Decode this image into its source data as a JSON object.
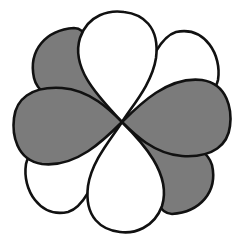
{
  "diagram": {
    "title": "",
    "center": [
      122,
      122
    ],
    "colors": {
      "shaded": "#7b7b7b",
      "unshaded": "#ffffff",
      "outline": "#111111",
      "background": "#ffffff"
    },
    "lobes": [
      {
        "id": "diag-ne",
        "phase": "unshaded",
        "d": "M122 122 C140 100 150 40 176 32 C205 26 222 55 218 80 C214 100 170 118 122 122 Z"
      },
      {
        "id": "diag-se",
        "phase": "shaded",
        "d": "M122 122 C150 126 205 140 212 165 C218 192 200 212 172 214 C150 214 146 160 122 122 Z"
      },
      {
        "id": "diag-sw",
        "phase": "unshaded",
        "d": "M122 122 C104 144 94 204 68 212 C40 218 22 190 26 164 C30 144 74 126 122 122 Z"
      },
      {
        "id": "diag-nw",
        "phase": "shaded",
        "d": "M122 122 C94 118 40 104 34 78 C28 50 46 30 74 28 C96 28 100 84 122 122 Z"
      },
      {
        "id": "vert-top",
        "phase": "unshaded",
        "d": "M122 122 C102 100 70 70 80 38 C88 14 110 10 124 12 C142 14 160 26 156 58 C152 84 132 106 122 122 Z"
      },
      {
        "id": "vert-bottom",
        "phase": "unshaded",
        "d": "M122 122 C142 142 172 174 162 206 C154 228 134 234 120 232 C102 230 84 218 88 186 C92 160 112 138 122 122 Z"
      },
      {
        "id": "horiz-left",
        "phase": "shaded",
        "d": "M122 122 C104 140 76 168 42 164 C16 160 12 134 14 118 C16 100 30 86 62 88 C90 90 110 110 122 122 Z"
      },
      {
        "id": "horiz-right",
        "phase": "shaded",
        "d": "M122 122 C140 104 168 76 202 80 C228 84 232 110 230 126 C228 144 214 158 182 156 C154 154 134 134 122 122 Z"
      }
    ]
  }
}
